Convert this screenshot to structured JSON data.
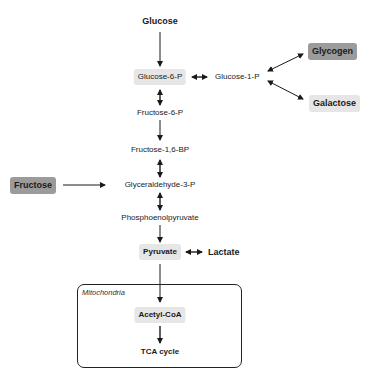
{
  "diagram": {
    "nodes": {
      "glucose": "Glucose",
      "glucose_6_p": "Glucose-6-P",
      "glucose_1_p": "Glucose-1-P",
      "glycogen": "Glycogen",
      "galactose": "Galactose",
      "fructose_6_p": "Fructose-6-P",
      "fructose_1_6_bp": "Fructose-1,6-BP",
      "fructose": "Fructose",
      "glyceraldehyde_3_p": "Glyceraldehyde-3-P",
      "phosphoenolpyruvate": "Phosphoenolpyruvate",
      "pyruvate": "Pyruvate",
      "lactate": "Lactate",
      "acetyl_coa": "Acetyl-CoA",
      "tca_cycle": "TCA cycle"
    },
    "compartment": {
      "label": "Mitochondria"
    },
    "edges": [
      {
        "from": "Glucose",
        "to": "Glucose-6-P",
        "type": "one-way"
      },
      {
        "from": "Glucose-6-P",
        "to": "Glucose-1-P",
        "type": "two-way"
      },
      {
        "from": "Glucose-1-P",
        "to": "Glycogen",
        "type": "two-way"
      },
      {
        "from": "Glucose-1-P",
        "to": "Galactose",
        "type": "two-way"
      },
      {
        "from": "Glucose-6-P",
        "to": "Fructose-6-P",
        "type": "two-way"
      },
      {
        "from": "Fructose-6-P",
        "to": "Fructose-1,6-BP",
        "type": "one-way"
      },
      {
        "from": "Fructose-1,6-BP",
        "to": "Glyceraldehyde-3-P",
        "type": "two-way"
      },
      {
        "from": "Fructose",
        "to": "Glyceraldehyde-3-P",
        "type": "one-way"
      },
      {
        "from": "Glyceraldehyde-3-P",
        "to": "Phosphoenolpyruvate",
        "type": "two-way"
      },
      {
        "from": "Phosphoenolpyruvate",
        "to": "Pyruvate",
        "type": "one-way"
      },
      {
        "from": "Pyruvate",
        "to": "Lactate",
        "type": "two-way"
      },
      {
        "from": "Pyruvate",
        "to": "Acetyl-CoA",
        "type": "one-way"
      },
      {
        "from": "Acetyl-CoA",
        "to": "TCA cycle",
        "type": "one-way"
      }
    ],
    "colors": {
      "highlight_light": "#e6e6e6",
      "highlight_dark": "#9b9b9b",
      "line": "#1a1a1a"
    }
  }
}
